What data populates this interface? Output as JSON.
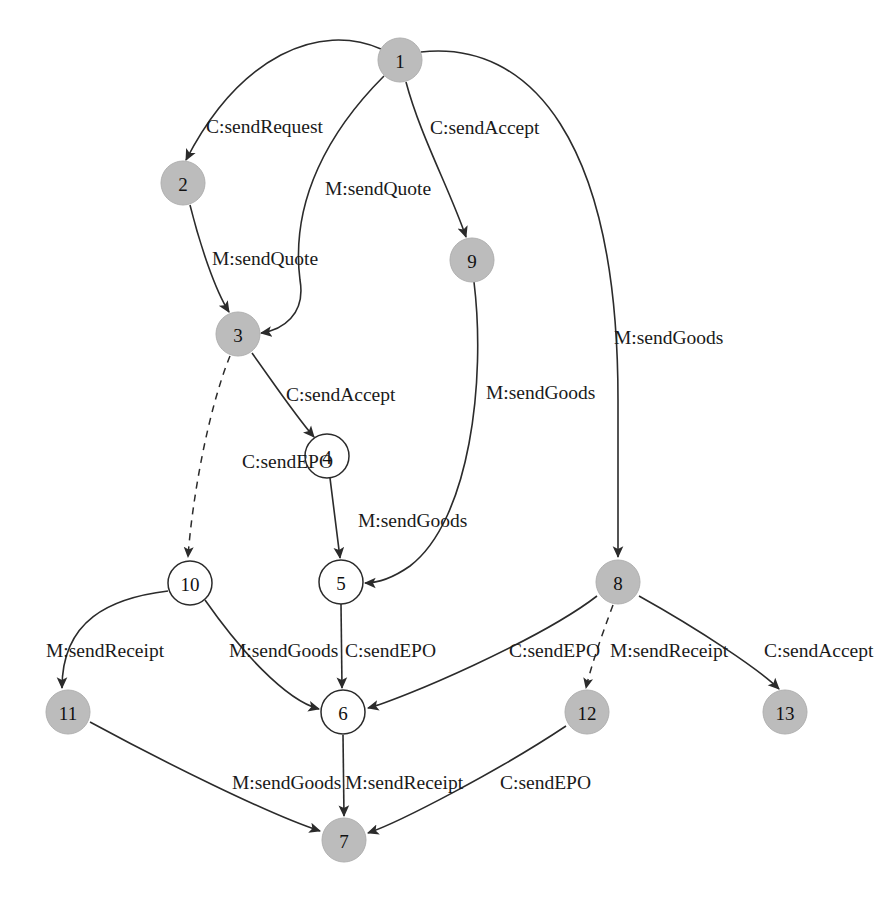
{
  "figure": {
    "title": "",
    "top_fragment": "",
    "background_color": "#ffffff",
    "filled_node_color": "#bcbcbc",
    "open_node_color": "#ffffff",
    "edge_color": "#2b2b2b"
  },
  "graph": {
    "type": "directed-state-transition-graph",
    "node_radius": 22,
    "nodes": [
      {
        "id": "1",
        "label": "1",
        "x": 400,
        "y": 60,
        "style": "filled"
      },
      {
        "id": "2",
        "label": "2",
        "x": 183,
        "y": 183,
        "style": "filled"
      },
      {
        "id": "3",
        "label": "3",
        "x": 238,
        "y": 334,
        "style": "filled"
      },
      {
        "id": "4",
        "label": "4",
        "x": 327,
        "y": 456,
        "style": "open"
      },
      {
        "id": "5",
        "label": "5",
        "x": 341,
        "y": 582,
        "style": "open"
      },
      {
        "id": "6",
        "label": "6",
        "x": 343,
        "y": 712,
        "style": "open"
      },
      {
        "id": "7",
        "label": "7",
        "x": 344,
        "y": 840,
        "style": "filled"
      },
      {
        "id": "8",
        "label": "8",
        "x": 618,
        "y": 582,
        "style": "filled"
      },
      {
        "id": "9",
        "label": "9",
        "x": 472,
        "y": 260,
        "style": "filled"
      },
      {
        "id": "10",
        "label": "10",
        "x": 190,
        "y": 583,
        "style": "open"
      },
      {
        "id": "11",
        "label": "11",
        "x": 68,
        "y": 712,
        "style": "filled"
      },
      {
        "id": "12",
        "label": "12",
        "x": 587,
        "y": 712,
        "style": "filled"
      },
      {
        "id": "13",
        "label": "13",
        "x": 785,
        "y": 712,
        "style": "filled"
      }
    ],
    "edges": [
      {
        "id": "e1",
        "from": "1",
        "to": "2",
        "label": "C:sendRequest",
        "style": "solid",
        "label_x": 206,
        "label_y": 126,
        "path": "M 381,49 C 320,22 240,55 186,160"
      },
      {
        "id": "e2",
        "from": "1",
        "to": "9",
        "label": "C:sendAccept",
        "style": "solid",
        "label_x": 430,
        "label_y": 127,
        "path": "M 406,82 C 420,135 450,190 466,237"
      },
      {
        "id": "e3",
        "from": "1",
        "to": "3",
        "label": "M:sendQuote",
        "style": "solid",
        "label_x": 325,
        "label_y": 188,
        "path": "M 384,76 C 330,130 290,200 300,280 C 306,315 282,330 261,333"
      },
      {
        "id": "e4",
        "from": "2",
        "to": "3",
        "label": "M:sendQuote",
        "style": "solid",
        "label_x": 212,
        "label_y": 258,
        "path": "M 190,205 C 200,245 215,290 229,312"
      },
      {
        "id": "e5",
        "from": "3",
        "to": "4",
        "label": "C:sendAccept",
        "style": "solid",
        "label_x": 286,
        "label_y": 394,
        "path": "M 252,353 C 275,385 295,415 314,437"
      },
      {
        "id": "e6",
        "from": "3",
        "to": "10",
        "label": "C:sendEPO",
        "style": "dashed",
        "label_x": 242,
        "label_y": 461,
        "path": "M 230,356 C 208,410 192,500 188,557"
      },
      {
        "id": "e7",
        "from": "4",
        "to": "5",
        "label": "M:sendGoods",
        "style": "solid",
        "label_x": 358,
        "label_y": 520,
        "path": "M 330,478 C 334,510 338,540 340,558"
      },
      {
        "id": "e8",
        "from": "9",
        "to": "5",
        "label": "M:sendGoods",
        "style": "solid",
        "label_x": 486,
        "label_y": 392,
        "path": "M 474,282 C 486,380 470,520 410,566 C 390,580 375,583 365,583"
      },
      {
        "id": "e9",
        "from": "1",
        "to": "8",
        "label": "M:sendGoods",
        "style": "solid",
        "label_x": 614,
        "label_y": 337,
        "path": "M 421,52 C 530,40 618,140 618,400 L 618,557"
      },
      {
        "id": "e10",
        "from": "10",
        "to": "11",
        "label": "M:sendReceipt",
        "style": "solid",
        "label_x": 46,
        "label_y": 650,
        "path": "M 168,591 C 110,598 62,620 62,688"
      },
      {
        "id": "e11",
        "from": "10",
        "to": "6",
        "label": "M:sendGoods",
        "style": "solid",
        "label_x": 229,
        "label_y": 650,
        "path": "M 205,600 C 240,650 285,700 319,709"
      },
      {
        "id": "e12",
        "from": "5",
        "to": "6",
        "label": "C:sendEPO",
        "style": "solid",
        "label_x": 345,
        "label_y": 650,
        "path": "M 341,604 L 342,688"
      },
      {
        "id": "e13",
        "from": "8",
        "to": "6",
        "label": "C:sendEPO",
        "style": "solid",
        "label_x": 509,
        "label_y": 650,
        "path": "M 597,596 C 540,640 400,700 368,708"
      },
      {
        "id": "e14",
        "from": "8",
        "to": "12",
        "label": "M:sendReceipt",
        "style": "dashed",
        "label_x": 610,
        "label_y": 650,
        "path": "M 613,605 C 600,640 590,670 586,688"
      },
      {
        "id": "e15",
        "from": "8",
        "to": "13",
        "label": "C:sendAccept",
        "style": "solid",
        "label_x": 764,
        "label_y": 650,
        "path": "M 639,596 C 700,630 760,670 779,689"
      },
      {
        "id": "e16",
        "from": "11",
        "to": "7",
        "label": "M:sendGoods",
        "style": "solid",
        "label_x": 232,
        "label_y": 782,
        "path": "M 90,722 C 160,760 270,815 320,831"
      },
      {
        "id": "e17",
        "from": "6",
        "to": "7",
        "label": "M:sendReceipt",
        "style": "solid",
        "label_x": 345,
        "label_y": 782,
        "path": "M 343,735 L 344,816"
      },
      {
        "id": "e18",
        "from": "12",
        "to": "7",
        "label": "C:sendEPO",
        "style": "solid",
        "label_x": 500,
        "label_y": 782,
        "path": "M 566,726 C 500,770 400,822 368,833"
      }
    ]
  },
  "legend": {
    "transition_prefixes": [
      "C",
      "M"
    ],
    "messages": [
      "sendRequest",
      "sendQuote",
      "sendAccept",
      "sendEPO",
      "sendGoods",
      "sendReceipt"
    ]
  }
}
